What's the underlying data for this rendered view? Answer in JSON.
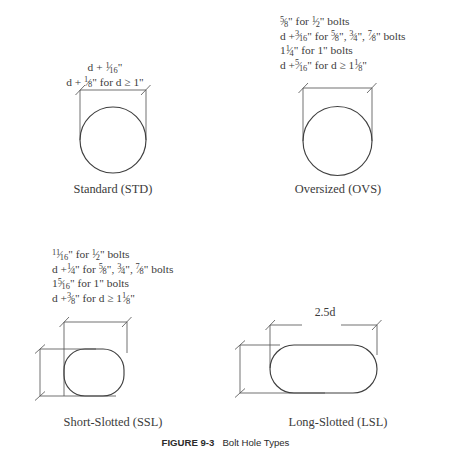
{
  "figure": {
    "number": "FIGURE 9-3",
    "title": "Bolt Hole Types"
  },
  "panels": {
    "std": {
      "caption": "Standard (STD)",
      "notes": [
        {
          "parts": [
            {
              "t": "text",
              "v": "d + "
            },
            {
              "t": "frac",
              "n": "1",
              "d": "16"
            },
            {
              "t": "text",
              "v": "\""
            }
          ]
        },
        {
          "parts": [
            {
              "t": "text",
              "v": "d + "
            },
            {
              "t": "frac",
              "n": "1",
              "d": "8"
            },
            {
              "t": "text",
              "v": "\" for d ≥ 1\""
            }
          ]
        }
      ],
      "notes_plain": [
        "d + 1/16\"",
        "d + 1/8\" for d ≥ 1\""
      ],
      "shape": "circle",
      "horizontal_dimension": "d + 1/16\"",
      "vertical_dimension": ""
    },
    "ovs": {
      "caption": "Oversized (OVS)",
      "notes": [
        {
          "parts": [
            {
              "t": "frac",
              "n": "5",
              "d": "8"
            },
            {
              "t": "text",
              "v": "\" for "
            },
            {
              "t": "frac",
              "n": "1",
              "d": "2"
            },
            {
              "t": "text",
              "v": "\" bolts"
            }
          ]
        },
        {
          "parts": [
            {
              "t": "text",
              "v": "d +"
            },
            {
              "t": "frac",
              "n": "3",
              "d": "16"
            },
            {
              "t": "text",
              "v": "\" for "
            },
            {
              "t": "frac",
              "n": "5",
              "d": "8"
            },
            {
              "t": "text",
              "v": "\", "
            },
            {
              "t": "frac",
              "n": "3",
              "d": "4"
            },
            {
              "t": "text",
              "v": "\", "
            },
            {
              "t": "frac",
              "n": "7",
              "d": "8"
            },
            {
              "t": "text",
              "v": "\" bolts"
            }
          ]
        },
        {
          "parts": [
            {
              "t": "text",
              "v": "1"
            },
            {
              "t": "frac",
              "n": "1",
              "d": "4"
            },
            {
              "t": "text",
              "v": "\" for 1\" bolts"
            }
          ]
        },
        {
          "parts": [
            {
              "t": "text",
              "v": "d +"
            },
            {
              "t": "frac",
              "n": "5",
              "d": "16"
            },
            {
              "t": "text",
              "v": "\" for d ≥ 1"
            },
            {
              "t": "frac",
              "n": "1",
              "d": "8"
            },
            {
              "t": "text",
              "v": "\""
            }
          ]
        }
      ],
      "notes_plain": [
        "5/8\" for 1/2\" bolts",
        "d +3/16\" for 5/8\", 3/4\", 7/8\" bolts",
        "1 1/4\" for 1\" bolts",
        "d +5/16\" for d ≥ 1 1/8\""
      ],
      "shape": "circle",
      "vertical_dimension": ""
    },
    "ssl": {
      "caption": "Short-Slotted (SSL)",
      "notes": [
        {
          "parts": [
            {
              "t": "frac",
              "n": "11",
              "d": "16"
            },
            {
              "t": "text",
              "v": "\" for "
            },
            {
              "t": "frac",
              "n": "1",
              "d": "2"
            },
            {
              "t": "text",
              "v": "\" bolts"
            }
          ]
        },
        {
          "parts": [
            {
              "t": "text",
              "v": "d +"
            },
            {
              "t": "frac",
              "n": "1",
              "d": "4"
            },
            {
              "t": "text",
              "v": "\" for "
            },
            {
              "t": "frac",
              "n": "5",
              "d": "8"
            },
            {
              "t": "text",
              "v": "\", "
            },
            {
              "t": "frac",
              "n": "3",
              "d": "4"
            },
            {
              "t": "text",
              "v": "\", "
            },
            {
              "t": "frac",
              "n": "7",
              "d": "8"
            },
            {
              "t": "text",
              "v": "\" bolts"
            }
          ]
        },
        {
          "parts": [
            {
              "t": "text",
              "v": "1"
            },
            {
              "t": "frac",
              "n": "5",
              "d": "16"
            },
            {
              "t": "text",
              "v": "\" for 1\" bolts"
            }
          ]
        },
        {
          "parts": [
            {
              "t": "text",
              "v": "d +"
            },
            {
              "t": "frac",
              "n": "3",
              "d": "8"
            },
            {
              "t": "text",
              "v": "\" for d ≥ 1"
            },
            {
              "t": "frac",
              "n": "1",
              "d": "8"
            },
            {
              "t": "text",
              "v": "\""
            }
          ]
        }
      ],
      "notes_plain": [
        "11/16\" for 1/2\" bolts",
        "d +1/4\" for 5/8\", 3/4\", 7/8\" bolts",
        "1 5/16\" for 1\" bolts",
        "d +3/8\" for d ≥ 1 1/8\""
      ],
      "shape": "rounded-rectangle",
      "vertical_dimension": {
        "parts": [
          {
            "t": "text",
            "v": "d + "
          },
          {
            "t": "frac",
            "n": "1",
            "d": "16"
          },
          {
            "t": "text",
            "v": "\""
          }
        ]
      },
      "vertical_dimension_plain": "d + 1/16\""
    },
    "lsl": {
      "caption": "Long-Slotted (LSL)",
      "shape": "stadium",
      "horizontal_dimension": "2.5d",
      "vertical_dimension": {
        "parts": [
          {
            "t": "text",
            "v": "d + "
          },
          {
            "t": "frac",
            "n": "1",
            "d": "16"
          },
          {
            "t": "text",
            "v": "\""
          }
        ]
      },
      "vertical_dimension_plain": "d + 1/16\""
    }
  },
  "colors": {
    "background": "#ffffff",
    "dimension_line": "#595959",
    "shape_outline": "#3f3f3f",
    "text": "#3a3a3a",
    "caption_text": "#2b2b2b"
  }
}
